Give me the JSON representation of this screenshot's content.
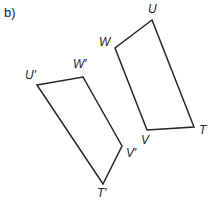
{
  "figure": {
    "part_label": "b)",
    "part_label_pos": {
      "x": 4,
      "y": 6
    },
    "stroke_color": "#262626",
    "background_color": "#ffffff",
    "stroke_width": 1.5,
    "width": 216,
    "height": 202
  },
  "shapes": [
    {
      "name": "quadrilateral-UWVT",
      "vertex_order": "U-W-V-T",
      "points": "152,20 115,48 147,130 194,127",
      "vertices": [
        {
          "label": "U",
          "x": 152,
          "y": 20,
          "label_x": 148,
          "label_y": 3
        },
        {
          "label": "W",
          "x": 115,
          "y": 48,
          "label_x": 99,
          "label_y": 36
        },
        {
          "label": "V",
          "x": 147,
          "y": 130,
          "label_x": 141,
          "label_y": 134
        },
        {
          "label": "T",
          "x": 194,
          "y": 127,
          "label_x": 199,
          "label_y": 124
        }
      ]
    },
    {
      "name": "quadrilateral-UWVT-prime",
      "vertex_order": "U'-W'-V'-T'",
      "points": "37,85 83,77 122,146 103,184",
      "vertices": [
        {
          "label": "U′",
          "x": 37,
          "y": 85,
          "label_x": 25,
          "label_y": 69
        },
        {
          "label": "W′",
          "x": 83,
          "y": 77,
          "label_x": 73,
          "label_y": 58
        },
        {
          "label": "V′",
          "x": 122,
          "y": 146,
          "label_x": 126,
          "label_y": 147
        },
        {
          "label": "T′",
          "x": 103,
          "y": 184,
          "label_x": 97,
          "label_y": 187
        }
      ]
    }
  ]
}
